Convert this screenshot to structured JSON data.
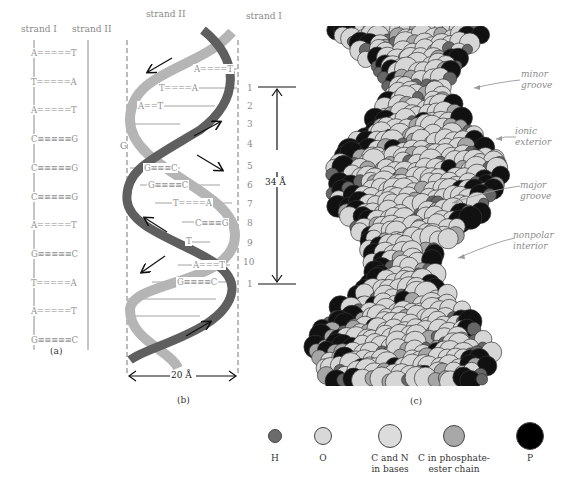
{
  "panel_a": {
    "strand_left": "strand I",
    "strand_right": "strand II",
    "pairs": [
      "A=====T",
      "T=====A",
      "A=====T",
      "C≡≡≡≡≡G",
      "C≡≡≡≡≡G",
      "C≡≡≡≡≡G",
      "A=====T",
      "G≡≡≡≡≡C",
      "T=====A",
      "A=====T",
      "G≡≡≡≡≡C"
    ],
    "caption": "(a)"
  },
  "panel_b": {
    "strand_left": "strand II",
    "strand_right": "strand I",
    "pairs": [
      {
        "text": "A====T"
      },
      {
        "text": "T====A"
      },
      {
        "text": "A==T"
      },
      {
        "text": "G≡≡≡C"
      },
      {
        "text": "G≡≡≡≡C"
      },
      {
        "text": "T====A"
      },
      {
        "text": "C≡≡≡G"
      },
      {
        "text": "T"
      },
      {
        "text": "A===T"
      },
      {
        "text": "G≡≡≡≡C"
      }
    ],
    "side_letter": "G",
    "numbers": [
      "1",
      "2",
      "3",
      "4",
      "5",
      "6",
      "7",
      "8",
      "9",
      "10",
      "1"
    ],
    "pitch_label": "34 Å",
    "width_label": "20 Å",
    "caption": "(b)"
  },
  "panel_c": {
    "annotations": [
      {
        "line1": "minor",
        "line2": "groove"
      },
      {
        "line1": "ionic",
        "line2": "exterior"
      },
      {
        "line1": "major",
        "line2": "groove"
      },
      {
        "line1": "nonpolar",
        "line2": "interior"
      }
    ],
    "caption": "(c)"
  },
  "legend": {
    "items": [
      {
        "label_line1": "H",
        "label_line2": "",
        "color": "#6b6b6b",
        "size": 14
      },
      {
        "label_line1": "O",
        "label_line2": "",
        "color": "#d8d8d8",
        "size": 18
      },
      {
        "label_line1": "C and N",
        "label_line2": "in bases",
        "color": "#dcdcdc",
        "size": 24
      },
      {
        "label_line1": "C in phosphate-",
        "label_line2": "ester chain",
        "color": "#a8a8a8",
        "size": 22
      },
      {
        "label_line1": "P",
        "label_line2": "",
        "color": "#000000",
        "size": 28
      }
    ]
  },
  "colors": {
    "strand_dark": "#5f5f5f",
    "strand_light": "#b5b5b5",
    "text_gray": "#8a8a8a",
    "atom_light": "#d6d6d6",
    "atom_mid": "#a5a5a5",
    "atom_dark": "#666666",
    "atom_black": "#111111"
  }
}
